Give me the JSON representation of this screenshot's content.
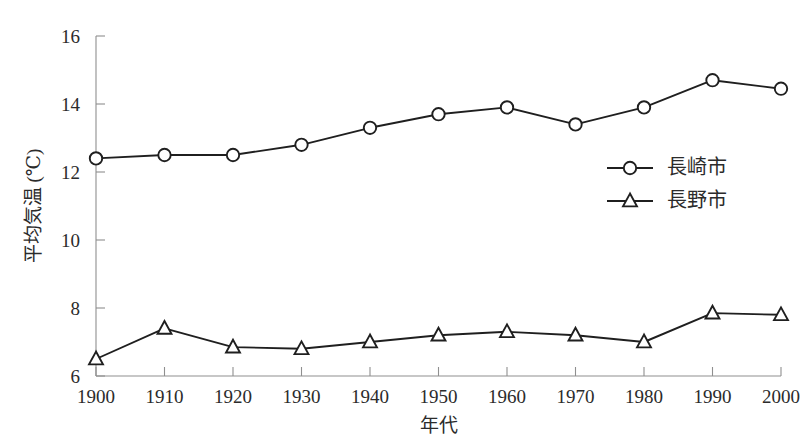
{
  "chart_data": {
    "type": "line",
    "title": "",
    "xlabel": "年代",
    "ylabel": "平均気温 (℃)",
    "categories": [
      "1900",
      "1910",
      "1920",
      "1930",
      "1940",
      "1950",
      "1960",
      "1970",
      "1980",
      "1990",
      "2000"
    ],
    "x": [
      1900,
      1910,
      1920,
      1930,
      1940,
      1950,
      1960,
      1970,
      1980,
      1990,
      2000
    ],
    "xlim": [
      1900,
      2000
    ],
    "ylim": [
      6,
      16
    ],
    "y_ticks": [
      6,
      8,
      10,
      12,
      14,
      16
    ],
    "y_tick_labels": [
      "6",
      "8",
      "10",
      "12",
      "14",
      "16"
    ],
    "grid": false,
    "legend_position": "center-right",
    "series": [
      {
        "name": "長崎市",
        "marker": "circle",
        "color": "#1f1f1f",
        "values": [
          12.4,
          12.5,
          12.5,
          12.8,
          13.3,
          13.7,
          13.9,
          13.4,
          13.9,
          14.7,
          14.45
        ]
      },
      {
        "name": "長野市",
        "marker": "triangle",
        "color": "#1f1f1f",
        "values": [
          6.5,
          7.4,
          6.85,
          6.8,
          7.0,
          7.2,
          7.3,
          7.2,
          7.0,
          7.85,
          7.8
        ]
      }
    ]
  },
  "axis": {
    "y_label": "平均気温 (℃)",
    "x_label": "年代"
  },
  "legend": {
    "entries": [
      {
        "label": "長崎市",
        "marker": "circle"
      },
      {
        "label": "長野市",
        "marker": "triangle"
      }
    ]
  }
}
